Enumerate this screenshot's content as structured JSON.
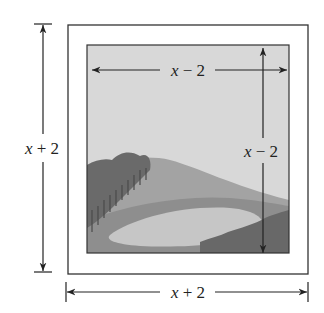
{
  "figure": {
    "outer_width_label": "x + 2",
    "outer_height_label": "x + 2",
    "inner_width_label": "x − 2",
    "inner_height_label": "x − 2",
    "picture": "landscape with hills, trees and a pond",
    "colors": {
      "line": "#2a2a2a",
      "sky": "#d6d6d6",
      "hill_far": "#9a9a9a",
      "hill_mid": "#ababab",
      "pond": "#c4c4c4",
      "trees": "#6e6e6e",
      "ground": "#8c8c8c"
    }
  },
  "labels": {
    "left": {
      "var": "x",
      "rest": " + 2"
    },
    "bottom": {
      "var": "x",
      "rest": " + 2"
    },
    "top_inner": {
      "var": "x",
      "rest": " − 2"
    },
    "right_inner": {
      "var": "x",
      "rest": " − 2"
    }
  }
}
